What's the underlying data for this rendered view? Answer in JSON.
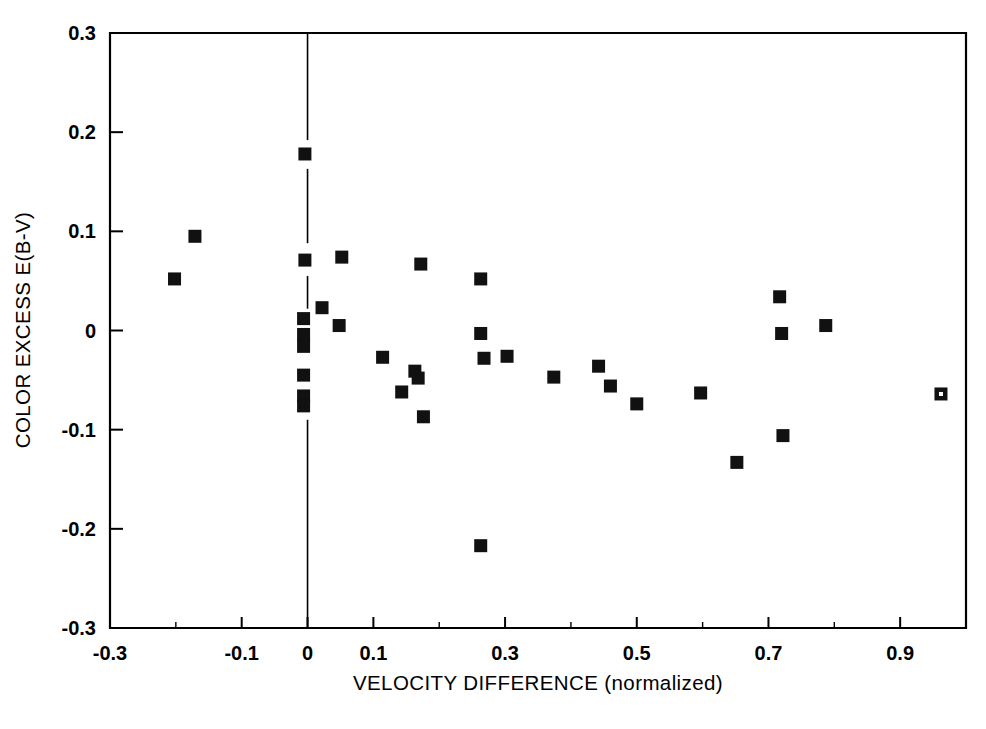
{
  "figure": {
    "background": "#ffffff",
    "ink_color": "#000000",
    "marker_color": "#111111"
  },
  "chart_data": {
    "type": "scatter",
    "title": "",
    "subtitle": "",
    "xlabel": "VELOCITY DIFFERENCE (normalized)",
    "ylabel": "COLOR EXCESS E(B-V)",
    "xlim": [
      -0.3,
      1.0
    ],
    "ylim": [
      -0.3,
      0.3
    ],
    "xticks": [
      -0.3,
      -0.1,
      0,
      0.1,
      0.3,
      0.5,
      0.7,
      0.9
    ],
    "xtick_labels": [
      "-0.3",
      "-0.1",
      "0",
      "0.1",
      "0.3",
      "0.5",
      "0.7",
      "0.9"
    ],
    "xticks_minor": [
      -0.2,
      0.2,
      0.4,
      0.6,
      0.8,
      1.0
    ],
    "yticks": [
      0.3,
      0.2,
      0.1,
      0,
      -0.1,
      -0.2,
      -0.3
    ],
    "ytick_labels": [
      "0.3",
      "0.2",
      "0.1",
      "0",
      "-0.1",
      "-0.2",
      "-0.3"
    ],
    "grid": false,
    "legend": null,
    "annotations": [
      {
        "name": "zero-velocity-reference-line",
        "type": "vline",
        "x": 0.0,
        "y_from": -0.3,
        "y_to": 0.3,
        "style": "thin-solid-broken-by-markers"
      }
    ],
    "marker_style": "filled-square",
    "marker_size_px": 13,
    "series": [
      {
        "name": "stars",
        "marker": "filled-square",
        "points": [
          {
            "x": -0.202,
            "y": 0.052
          },
          {
            "x": -0.171,
            "y": 0.095
          },
          {
            "x": -0.004,
            "y": 0.178
          },
          {
            "x": -0.004,
            "y": 0.071
          },
          {
            "x": -0.006,
            "y": 0.012
          },
          {
            "x": -0.006,
            "y": -0.004
          },
          {
            "x": -0.006,
            "y": -0.016
          },
          {
            "x": -0.006,
            "y": -0.045
          },
          {
            "x": -0.006,
            "y": -0.066
          },
          {
            "x": -0.006,
            "y": -0.076
          },
          {
            "x": 0.022,
            "y": 0.023
          },
          {
            "x": 0.052,
            "y": 0.074
          },
          {
            "x": 0.048,
            "y": 0.005
          },
          {
            "x": 0.114,
            "y": -0.027
          },
          {
            "x": 0.143,
            "y": -0.062
          },
          {
            "x": 0.163,
            "y": -0.041
          },
          {
            "x": 0.168,
            "y": -0.048
          },
          {
            "x": 0.172,
            "y": 0.067
          },
          {
            "x": 0.176,
            "y": -0.087
          },
          {
            "x": 0.263,
            "y": 0.052
          },
          {
            "x": 0.263,
            "y": -0.003
          },
          {
            "x": 0.268,
            "y": -0.028
          },
          {
            "x": 0.263,
            "y": -0.217
          },
          {
            "x": 0.303,
            "y": -0.026
          },
          {
            "x": 0.374,
            "y": -0.047
          },
          {
            "x": 0.442,
            "y": -0.036
          },
          {
            "x": 0.46,
            "y": -0.056
          },
          {
            "x": 0.5,
            "y": -0.074
          },
          {
            "x": 0.597,
            "y": -0.063
          },
          {
            "x": 0.652,
            "y": -0.133
          },
          {
            "x": 0.717,
            "y": 0.034
          },
          {
            "x": 0.72,
            "y": -0.003
          },
          {
            "x": 0.722,
            "y": -0.106
          },
          {
            "x": 0.787,
            "y": 0.005
          }
        ]
      },
      {
        "name": "stars-open",
        "marker": "open-square",
        "points": [
          {
            "x": 0.962,
            "y": -0.064
          }
        ]
      }
    ]
  }
}
